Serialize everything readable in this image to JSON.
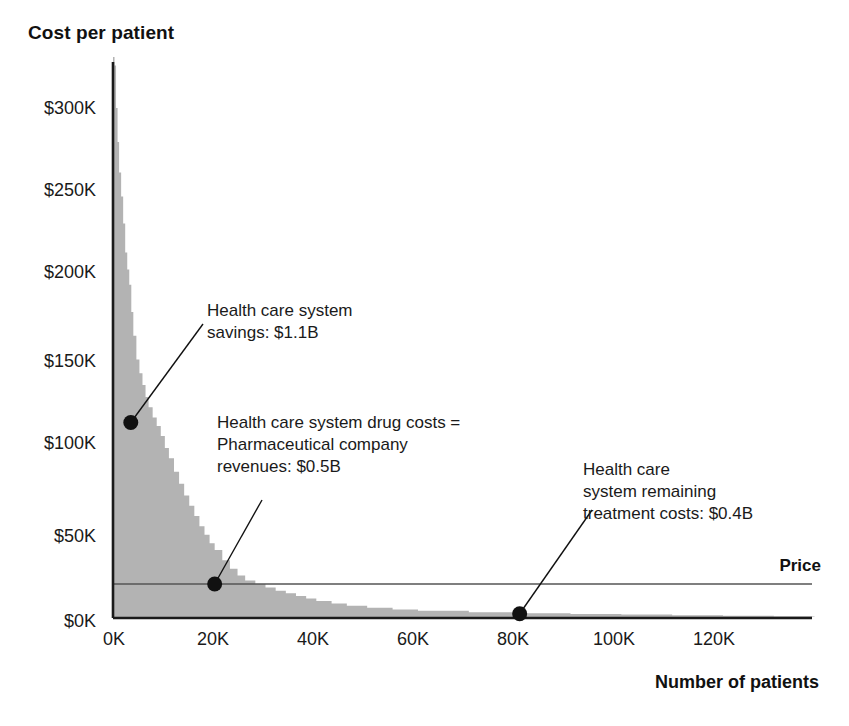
{
  "chart_data": {
    "type": "area",
    "title": "Cost per patient",
    "xlabel": "Number of patients",
    "ylabel": "Cost per patient",
    "xlim": [
      0,
      140000
    ],
    "ylim": [
      0,
      340000
    ],
    "grid": false,
    "legend_position": "none",
    "xtick_labels": [
      "0K",
      "20K",
      "40K",
      "60K",
      "80K",
      "100K",
      "120K"
    ],
    "xtick_values": [
      0,
      20000,
      40000,
      60000,
      80000,
      100000,
      120000
    ],
    "ytick_labels": [
      "$0K",
      "$50K",
      "$100K",
      "$150K",
      "$200K",
      "$250K",
      "$300K"
    ],
    "ytick_values": [
      0,
      50000,
      100000,
      150000,
      200000,
      250000,
      300000
    ],
    "series": [
      {
        "name": "Cost per patient",
        "x": [
          0,
          300,
          600,
          900,
          1200,
          1600,
          2000,
          2400,
          2800,
          3200,
          3600,
          4000,
          4600,
          5200,
          5800,
          6400,
          7000,
          7800,
          8600,
          9400,
          10200,
          11000,
          12000,
          13000,
          14000,
          15000,
          16000,
          17000,
          18000,
          19000,
          20000,
          21500,
          23000,
          24500,
          26000,
          28000,
          30000,
          32000,
          34000,
          36000,
          38000,
          40000,
          43000,
          46000,
          50000,
          55000,
          60000,
          70000,
          80000,
          90000,
          100000,
          110000,
          120000,
          130000,
          138000
        ],
        "y": [
          330000,
          325000,
          300000,
          280000,
          262000,
          248000,
          232000,
          215000,
          205000,
          196000,
          180000,
          166000,
          152000,
          144000,
          137000,
          130000,
          124000,
          118000,
          113000,
          107000,
          100000,
          94000,
          86000,
          79000,
          72000,
          66000,
          60000,
          54000,
          49000,
          44000,
          40000,
          34000,
          29000,
          25000,
          22000,
          20000,
          18000,
          16000,
          14500,
          13000,
          11500,
          10000,
          8500,
          7200,
          6000,
          5000,
          4200,
          3400,
          2800,
          2400,
          2000,
          1600,
          1300,
          1000,
          800
        ]
      }
    ],
    "price_line": {
      "label": "Price",
      "value": 20000,
      "extends_from": 0,
      "extends_to": 140000
    },
    "shaded_region": {
      "name": "drug-costs-rectangle",
      "x_from": 0,
      "x_to": 26000,
      "y_from": 0,
      "y_to": 20000
    },
    "markers": [
      {
        "name": "savings-marker",
        "x": 3500,
        "y": 115000
      },
      {
        "name": "drug-costs-marker",
        "x": 20000,
        "y": 20000
      },
      {
        "name": "remaining-costs-marker",
        "x": 80000,
        "y": 2500
      }
    ],
    "annotations": [
      {
        "name": "savings-annotation",
        "text": "Health care system\nsavings: $1.1B",
        "value": "$1.1B",
        "target": {
          "x": 3500,
          "y": 115000
        }
      },
      {
        "name": "drug-costs-annotation",
        "text": "Health care system drug costs =\nPharmaceutical company\nrevenues: $0.5B",
        "value": "$0.5B",
        "target": {
          "x": 20000,
          "y": 20000
        }
      },
      {
        "name": "remaining-costs-annotation",
        "text": "Health care\nsystem remaining\ntreatment costs: $0.4B",
        "value": "$0.4B",
        "target": {
          "x": 80000,
          "y": 2500
        }
      }
    ],
    "colors": {
      "area_fill": "#b3b3b3",
      "shaded_region_fill": "#d2d2d2",
      "axis": "#1a1a1a",
      "price_line": "#555555",
      "marker": "#111111",
      "text": "#1a1a1a"
    }
  }
}
